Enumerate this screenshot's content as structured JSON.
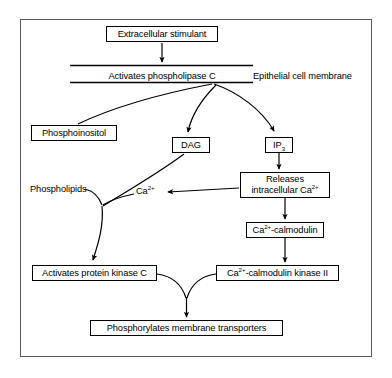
{
  "diagram": {
    "frame": {
      "border_color": "#555555"
    },
    "stroke_color": "#000000",
    "background_color": "#ffffff",
    "membrane": {
      "inner_label": "Activates phospholipase C",
      "caption": "Epithelial cell membrane"
    },
    "nodes": {
      "stimulant": "Extracellular stimulant",
      "phosphoinositol": "Phosphoinositol",
      "dag": "DAG",
      "ip3_main": "IP",
      "ip3_sub": "3",
      "releases_line1": "Releases",
      "releases_line2_pre": "intracellular Ca",
      "releases_line2_sup": "2+",
      "calmodulin_pre": "Ca",
      "calmodulin_sup": "2+",
      "calmodulin_post": "-calmodulin",
      "pkc": "Activates protein kinase C",
      "camk2_pre": "Ca",
      "camk2_sup": "2+",
      "camk2_post": "-calmodulin kinase II",
      "phosphorylates": "Phosphorylates membrane transporters"
    },
    "labels": {
      "calcium_pre": "Ca",
      "calcium_sup": "2+",
      "phospholipids": "Phospholipids"
    },
    "edges": [
      {
        "from": "stimulant",
        "to": "membrane",
        "style": "straight-arrow"
      },
      {
        "from": "membrane",
        "to": "phosphoinositol",
        "style": "curve-no-arrow"
      },
      {
        "from": "membrane",
        "to": "dag",
        "style": "curve-arrow"
      },
      {
        "from": "membrane",
        "to": "ip3",
        "style": "curve-arrow"
      },
      {
        "from": "ip3",
        "to": "releases",
        "style": "straight-arrow"
      },
      {
        "from": "releases",
        "to": "calcium-label",
        "style": "straight-arrow"
      },
      {
        "from": "releases",
        "to": "calmodulin",
        "style": "straight-arrow"
      },
      {
        "from": "calmodulin",
        "to": "camk2",
        "style": "straight-arrow"
      },
      {
        "from": "dag",
        "to": "junction",
        "style": "curve-no-arrow"
      },
      {
        "from": "calcium-label",
        "to": "junction",
        "style": "curve-no-arrow"
      },
      {
        "from": "phospholipids",
        "to": "junction",
        "style": "leader-line"
      },
      {
        "from": "junction",
        "to": "pkc",
        "style": "curve-arrow"
      },
      {
        "from": "pkc",
        "to": "phosphorylates",
        "style": "curve-merge-arrow"
      },
      {
        "from": "camk2",
        "to": "phosphorylates",
        "style": "curve-merge-arrow"
      }
    ]
  }
}
